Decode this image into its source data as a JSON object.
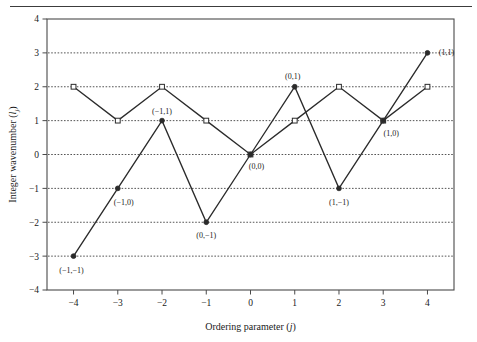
{
  "figure": {
    "background": "#ffffff",
    "frame_color": "#4a4a4a",
    "line_color": "#2b2b2b",
    "grid_color": "#555555"
  },
  "chart_data": {
    "type": "line",
    "title": "",
    "subtitle": "",
    "xlabel": "Ordering parameter (j)",
    "ylabel": "Integer wavenumber (lj)",
    "xlabel_main": "Ordering parameter (",
    "xlabel_italic": "j",
    "xlabel_tail": ")",
    "ylabel_main": "Integer wavenumber (",
    "ylabel_italic": "l",
    "ylabel_sub": "j",
    "ylabel_tail": ")",
    "xlim": [
      -4.6,
      4.6
    ],
    "ylim": [
      -4,
      4
    ],
    "xticks": [
      -4,
      -3,
      -2,
      -1,
      0,
      1,
      2,
      3,
      4
    ],
    "xticklabels": [
      "−4",
      "−3",
      "−2",
      "−1",
      "0",
      "1",
      "2",
      "3",
      "4"
    ],
    "yticks": [
      -4,
      -3,
      -2,
      -1,
      0,
      1,
      2,
      3,
      4
    ],
    "yticklabels": [
      "−4",
      "−3",
      "−2",
      "−1",
      "0",
      "1",
      "2",
      "3",
      "4"
    ],
    "grid": {
      "horizontal": true,
      "style": "dotted",
      "values": [
        -3,
        -2,
        -1,
        0,
        1,
        2,
        3
      ]
    },
    "legend": {
      "visible": false,
      "position": "none"
    },
    "x": [
      -4,
      -3,
      -2,
      -1,
      0,
      1,
      2,
      3,
      4
    ],
    "series": [
      {
        "name": "open-square-series",
        "marker": "open-square",
        "values": [
          2,
          1,
          2,
          1,
          0,
          1,
          2,
          1,
          2
        ]
      },
      {
        "name": "filled-circle-series",
        "marker": "filled-circle",
        "values": [
          -3,
          -1,
          1,
          -2,
          0,
          2,
          -1,
          1,
          3
        ]
      }
    ],
    "annotations": [
      {
        "text": "(−1,−1)",
        "x": -4,
        "y": -3,
        "dx": -2,
        "dy": 17,
        "anchor": "middle"
      },
      {
        "text": "(−1,0)",
        "x": -3,
        "y": -1,
        "dx": 6,
        "dy": 17,
        "anchor": "middle"
      },
      {
        "text": "(−1,1)",
        "x": -2,
        "y": 1,
        "dx": 0,
        "dy": -7,
        "anchor": "middle"
      },
      {
        "text": "(0,−1)",
        "x": -1,
        "y": -2,
        "dx": 0,
        "dy": 16,
        "anchor": "middle"
      },
      {
        "text": "(0,0)",
        "x": 0,
        "y": 0,
        "dx": 6,
        "dy": 14,
        "anchor": "middle"
      },
      {
        "text": "(0,1)",
        "x": 1,
        "y": 2,
        "dx": -2,
        "dy": -8,
        "anchor": "middle"
      },
      {
        "text": "(1,−1)",
        "x": 2,
        "y": -1,
        "dx": 0,
        "dy": 17,
        "anchor": "middle"
      },
      {
        "text": "(1,0)",
        "x": 3,
        "y": 1,
        "dx": 8,
        "dy": 15,
        "anchor": "middle"
      },
      {
        "text": "(1,1)",
        "x": 4,
        "y": 3,
        "dx": 19,
        "dy": 2,
        "anchor": "middle"
      }
    ]
  }
}
